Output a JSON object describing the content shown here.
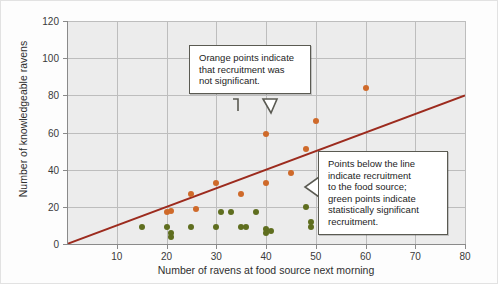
{
  "chart_data": {
    "type": "scatter",
    "title": "",
    "xlabel": "Number of ravens at food source next morning",
    "ylabel": "Number of knowledgeable ravens",
    "xlim": [
      0,
      80
    ],
    "ylim": [
      0,
      120
    ],
    "xticks": [
      10,
      20,
      30,
      40,
      50,
      60,
      70,
      80
    ],
    "yticks": [
      0,
      20,
      40,
      60,
      80,
      100,
      120
    ],
    "grid": true,
    "legend": "none",
    "series": [
      {
        "name": "Recruitment not significant",
        "color": "#cf6a2a",
        "marker": "circle",
        "points": [
          [
            20,
            17
          ],
          [
            21,
            18
          ],
          [
            25,
            27
          ],
          [
            26,
            19
          ],
          [
            30,
            33
          ],
          [
            35,
            27
          ],
          [
            40,
            33
          ],
          [
            40,
            59
          ],
          [
            45,
            38
          ],
          [
            48,
            51
          ],
          [
            50,
            66
          ],
          [
            60,
            84
          ]
        ]
      },
      {
        "name": "Statistically significant recruitment",
        "color": "#5f6e1f",
        "marker": "circle",
        "points": [
          [
            15,
            9
          ],
          [
            20,
            9
          ],
          [
            21,
            6
          ],
          [
            21,
            4
          ],
          [
            25,
            9
          ],
          [
            30,
            9
          ],
          [
            31,
            17
          ],
          [
            33,
            17
          ],
          [
            35,
            9
          ],
          [
            36,
            9
          ],
          [
            38,
            17
          ],
          [
            40,
            8
          ],
          [
            40,
            6
          ],
          [
            41,
            7
          ],
          [
            48,
            20
          ],
          [
            49,
            12
          ],
          [
            49,
            9
          ]
        ]
      }
    ],
    "reference_line": {
      "name": "1:1 expectation line",
      "color": "#9c2b1e",
      "from": [
        0,
        0
      ],
      "to": [
        80,
        80
      ],
      "width": 2
    },
    "annotations": [
      {
        "id": "callout-orange",
        "text": "Orange points indicate that recruitment was not significant.",
        "lines": [
          "Orange points indicate",
          "that recruitment was",
          "not significant."
        ],
        "points_to": [
          40,
          59
        ]
      },
      {
        "id": "callout-green",
        "text": "Points below the line indicate recruitment to the food source; green points indicate statistically significant recruitment.",
        "lines": [
          "Points below the line",
          "indicate recruitment",
          "to the food source;",
          "green points indicate",
          "statistically significant",
          "recruitment."
        ],
        "points_to": [
          48,
          14
        ]
      }
    ]
  },
  "colors": {
    "orange": "#cf6a2a",
    "green": "#5f6e1f",
    "line": "#9c2b1e",
    "plot_bg": "#ececec",
    "grid": "#bdbdbd",
    "callout_border": "#5a5a52"
  }
}
